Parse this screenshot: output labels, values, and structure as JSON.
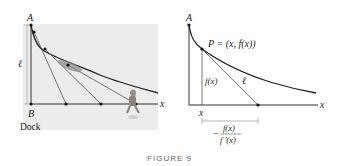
{
  "figure": {
    "caption": "FIGURE 9",
    "left_panel": {
      "label_A": "A",
      "label_B": "B",
      "label_ell": "ℓ",
      "label_x": "x",
      "label_dock": "Dock",
      "background": "#ececec"
    },
    "right_panel": {
      "label_A": "A",
      "label_P": "P = (x, f(x))",
      "label_fx": "f(x)",
      "label_ell": "ℓ",
      "label_x_axis": "x",
      "label_x_point": "x",
      "fraction_sign": "−",
      "fraction_num": "f(x)",
      "fraction_den": "f ′(x)"
    }
  }
}
